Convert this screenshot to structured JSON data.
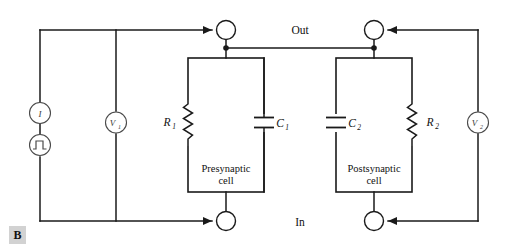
{
  "figure": {
    "panel_label": "B",
    "caption_io": {
      "out": "Out",
      "in": "In"
    }
  },
  "sources": {
    "current_source": {
      "label": "I",
      "symbol": "current-source-icon"
    },
    "pulse_generator": {
      "label": "",
      "symbol": "square-pulse-icon"
    }
  },
  "meters": [
    {
      "name": "voltmeter-1",
      "label": "V",
      "subscript": "1"
    },
    {
      "name": "voltmeter-2",
      "label": "V",
      "subscript": "2"
    }
  ],
  "cells": [
    {
      "name": "presynaptic-cell",
      "title_line1": "Presynaptic",
      "title_line2": "cell",
      "resistor": {
        "label": "R",
        "subscript": "1",
        "side": "left"
      },
      "capacitor": {
        "label": "C",
        "subscript": "1",
        "side": "right"
      }
    },
    {
      "name": "postsynaptic-cell",
      "title_line1": "Postsynaptic",
      "title_line2": "cell",
      "capacitor": {
        "label": "C",
        "subscript": "2",
        "side": "left"
      },
      "resistor": {
        "label": "R",
        "subscript": "2",
        "side": "right"
      }
    }
  ],
  "electrodes": [
    {
      "name": "electrode-presynaptic-out",
      "position": "top-left"
    },
    {
      "name": "electrode-postsynaptic-out",
      "position": "top-right"
    },
    {
      "name": "electrode-presynaptic-in",
      "position": "bottom-left"
    },
    {
      "name": "electrode-postsynaptic-in",
      "position": "bottom-right"
    }
  ],
  "colors": {
    "wire": "#1a1a1a",
    "background": "#ffffff",
    "badge_background": "#d2d2d2",
    "meter_stroke": "#4a4a4a"
  }
}
